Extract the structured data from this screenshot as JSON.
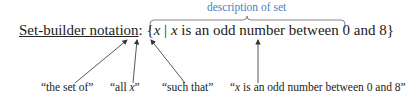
{
  "diagram": {
    "description_label": "description of set",
    "main": {
      "term": "Set-builder notation",
      "colon": ":",
      "open_brace": "{",
      "variable": "x",
      "bar": "|",
      "cond_var": "x",
      "condition": " is an odd number between 0 and 8",
      "close_brace": "}"
    },
    "labels": [
      {
        "text": "“the set of”"
      },
      {
        "pre": "“all ",
        "var": "x",
        "post": "”"
      },
      {
        "text": "“such that”"
      },
      {
        "pre": "“",
        "var": "x",
        "post": " is an odd number between 0 and 8”"
      }
    ],
    "colors": {
      "description": "#4a7fc1",
      "text": "#222222",
      "arrows": "#333333"
    }
  }
}
